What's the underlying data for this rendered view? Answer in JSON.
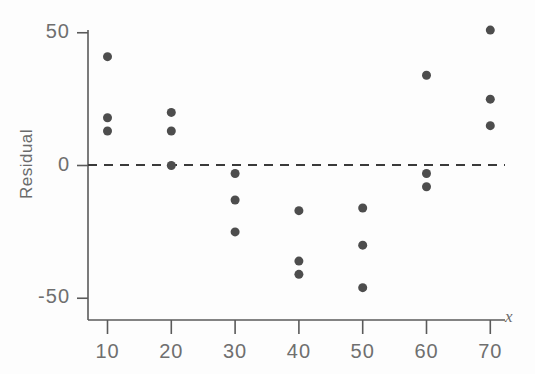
{
  "chart_data": {
    "type": "scatter",
    "title": "",
    "xlabel": "x",
    "ylabel": "Residual",
    "xlim": [
      5,
      75
    ],
    "ylim": [
      -60,
      58
    ],
    "grid": false,
    "legend": null,
    "x_ticks": [
      10,
      20,
      30,
      40,
      50,
      60,
      70
    ],
    "x_tick_labels": [
      "10",
      "20",
      "30",
      "40",
      "50",
      "60",
      "70"
    ],
    "y_ticks": [
      50,
      0,
      -50
    ],
    "y_tick_labels": [
      "50",
      "0",
      "-50"
    ],
    "reference_line": {
      "type": "horizontal-dashed",
      "y": 0,
      "label": "zero residual line",
      "color": "#3a3a3a"
    },
    "marker": {
      "shape": "circle",
      "color": "#4d4d4d",
      "size": 9
    },
    "points": [
      {
        "x": 10,
        "y": 41
      },
      {
        "x": 10,
        "y": 18
      },
      {
        "x": 10,
        "y": 13
      },
      {
        "x": 20,
        "y": 20
      },
      {
        "x": 20,
        "y": 13
      },
      {
        "x": 20,
        "y": 0
      },
      {
        "x": 30,
        "y": -3
      },
      {
        "x": 30,
        "y": -13
      },
      {
        "x": 30,
        "y": -25
      },
      {
        "x": 40,
        "y": -17
      },
      {
        "x": 40,
        "y": -36
      },
      {
        "x": 40,
        "y": -41
      },
      {
        "x": 50,
        "y": -16
      },
      {
        "x": 50,
        "y": -30
      },
      {
        "x": 50,
        "y": -46
      },
      {
        "x": 60,
        "y": 34
      },
      {
        "x": 60,
        "y": -3
      },
      {
        "x": 60,
        "y": -8
      },
      {
        "x": 70,
        "y": 51
      },
      {
        "x": 70,
        "y": 25
      },
      {
        "x": 70,
        "y": 15
      }
    ]
  },
  "axes": {
    "axis_color": "#5a5a5a",
    "background": "#fdfdfd"
  }
}
